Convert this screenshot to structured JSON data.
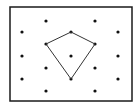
{
  "diagram": {
    "type": "dot-lattice-with-polygon",
    "frame": {
      "x": 10,
      "y": 7,
      "width": 122,
      "height": 94,
      "stroke": "#1a1a1a",
      "stroke_width": 1.5
    },
    "dot_color": "#111111",
    "dot_radius": 1.6,
    "dots": [
      [
        46,
        21
      ],
      [
        95,
        21
      ],
      [
        22,
        32
      ],
      [
        71,
        32
      ],
      [
        118,
        32
      ],
      [
        46,
        44
      ],
      [
        95,
        44
      ],
      [
        22,
        56
      ],
      [
        71,
        56
      ],
      [
        118,
        56
      ],
      [
        46,
        68
      ],
      [
        95,
        68
      ],
      [
        22,
        79
      ],
      [
        71,
        79
      ],
      [
        118,
        79
      ],
      [
        46,
        91
      ],
      [
        95,
        91
      ]
    ],
    "polygon": {
      "shape": "kite",
      "vertices": [
        [
          71,
          32
        ],
        [
          95,
          44
        ],
        [
          71,
          79
        ],
        [
          46,
          44
        ]
      ],
      "stroke": "#333333",
      "stroke_width": 1
    }
  }
}
